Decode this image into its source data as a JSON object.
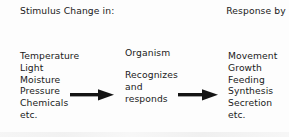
{
  "diagram": {
    "type": "flow",
    "orientation": "left-to-right",
    "background_color": "#fdfdfd",
    "text_color": "#1a1a1a",
    "stages": [
      {
        "id": "stimulus",
        "heading_lines": [
          "Stimulus",
          "Change in:"
        ],
        "items": [
          "Temperature",
          "Light",
          "Moisture",
          "Pressure",
          "Chemicals",
          "etc."
        ]
      },
      {
        "id": "organism",
        "heading_lines": [
          "Organism"
        ],
        "items": [
          "Recognizes",
          "and",
          "responds"
        ]
      },
      {
        "id": "response",
        "heading_lines": [
          "Response",
          "by"
        ],
        "items": [
          "Movement",
          "Growth",
          "Feeding",
          "Synthesis",
          "Secretion",
          "etc."
        ]
      }
    ],
    "connectors": [
      {
        "id": "arrow-1",
        "from": "stimulus",
        "to": "organism",
        "glyph": "right-arrow",
        "color": "#141414"
      },
      {
        "id": "arrow-2",
        "from": "organism",
        "to": "response",
        "glyph": "right-arrow",
        "color": "#141414"
      }
    ]
  }
}
